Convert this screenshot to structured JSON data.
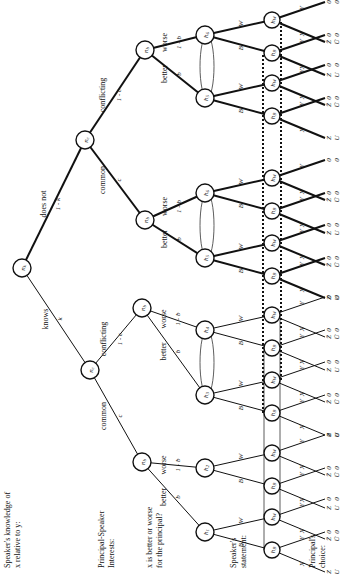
{
  "row_labels": {
    "knowledge": [
      "Speaker's knowledge of",
      "x relative to y:"
    ],
    "interests": [
      "Principal-Speaker",
      "Interests:"
    ],
    "better_worse": [
      "x is better or worse",
      "for the principal?"
    ],
    "statement": [
      "Speaker's",
      "statement:"
    ],
    "choice": [
      "Principal's",
      "choice:"
    ]
  },
  "root": {
    "label": "nk"
  },
  "knowledge_branches": [
    {
      "label": "knows",
      "prob": "k"
    },
    {
      "label": "does not",
      "prob": "1 - k"
    }
  ],
  "interest_node_label": "nc",
  "interest_branches": [
    {
      "label": "common",
      "prob": "c"
    },
    {
      "label": "conflicting",
      "prob": "1 - c"
    }
  ],
  "quality_node_label": "nb",
  "quality_branches": [
    {
      "label": "better",
      "prob": "b"
    },
    {
      "label": "worse",
      "prob": "1 - b"
    }
  ],
  "speaker_nodes": [
    "h1",
    "h2",
    "h3",
    "h4",
    "h5",
    "h6",
    "h5",
    "h6"
  ],
  "statement_branches": [
    "B",
    "W"
  ],
  "principal_nodes": [
    "hB",
    "hW"
  ],
  "choice_branches": [
    "X",
    "Y"
  ],
  "terminal_payoffs": [
    [
      "Z",
      "U"
    ],
    [
      "0",
      "0"
    ],
    [
      "Z̄",
      "Ū"
    ]
  ]
}
